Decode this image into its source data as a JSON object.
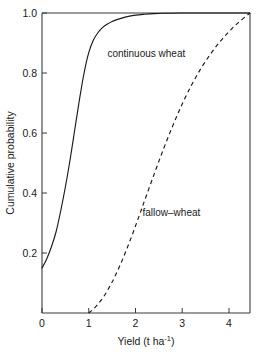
{
  "chart_data": {
    "type": "line",
    "title": "",
    "subtitle": "",
    "xlabel": "Yield (t ha",
    "xlabel_sup": "-1",
    "xlabel_tail": ")",
    "ylabel": "Cumulative probability",
    "xlim": [
      0,
      4.45
    ],
    "ylim": [
      0,
      1.0
    ],
    "grid": false,
    "legend_position": "inline-annotations",
    "xticks": [
      0,
      1,
      2,
      3,
      4
    ],
    "xtick_labels": [
      "0",
      "1",
      "2",
      "3",
      "4"
    ],
    "yticks": [
      0.2,
      0.4,
      0.6,
      0.8,
      1.0
    ],
    "ytick_labels": [
      "0.2",
      "0.4",
      "0.6",
      "0.8",
      "1.0"
    ],
    "series": [
      {
        "name": "continuous wheat",
        "style": "solid",
        "color": "#1a1a1a",
        "annotation": "continuous wheat",
        "x": [
          0.0,
          0.1,
          0.2,
          0.3,
          0.4,
          0.5,
          0.6,
          0.7,
          0.8,
          0.9,
          1.0,
          1.1,
          1.2,
          1.3,
          1.4,
          1.5,
          1.6,
          1.8,
          2.0,
          2.2,
          2.4,
          2.6,
          3.0,
          3.5,
          4.0,
          4.45
        ],
        "values": [
          0.15,
          0.18,
          0.22,
          0.27,
          0.34,
          0.42,
          0.51,
          0.61,
          0.71,
          0.8,
          0.868,
          0.91,
          0.935,
          0.952,
          0.963,
          0.972,
          0.978,
          0.987,
          0.993,
          0.996,
          0.998,
          0.999,
          1.0,
          1.0,
          1.0,
          1.0
        ]
      },
      {
        "name": "fallow-wheat",
        "style": "dashed",
        "color": "#1a1a1a",
        "annotation": "fallow–wheat",
        "x": [
          1.0,
          1.1,
          1.2,
          1.3,
          1.4,
          1.5,
          1.6,
          1.7,
          1.8,
          1.9,
          2.0,
          2.1,
          2.2,
          2.4,
          2.6,
          2.8,
          3.0,
          3.2,
          3.4,
          3.6,
          3.8,
          4.0,
          4.2,
          4.45
        ],
        "values": [
          0.0,
          0.013,
          0.03,
          0.05,
          0.075,
          0.103,
          0.135,
          0.17,
          0.208,
          0.248,
          0.29,
          0.333,
          0.377,
          0.463,
          0.547,
          0.625,
          0.697,
          0.76,
          0.815,
          0.862,
          0.903,
          0.938,
          0.968,
          1.0
        ]
      }
    ],
    "annotations": [
      {
        "text": "continuous wheat",
        "x": 1.4,
        "y": 0.855
      },
      {
        "text": "fallow–wheat",
        "x": 2.15,
        "y": 0.325
      }
    ]
  }
}
